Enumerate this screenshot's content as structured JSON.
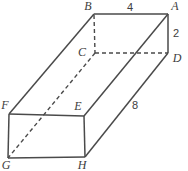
{
  "figure": {
    "shape": "rectangular-prism",
    "vertices": {
      "B": "B",
      "A": "A",
      "C": "C",
      "D": "D",
      "F": "F",
      "E": "E",
      "G": "G",
      "H": "H"
    },
    "dimensions": {
      "top_edge_BA": "4",
      "right_edge_AD": "2",
      "length_edge_DH": "8"
    }
  },
  "colors": {
    "line": "#4a4a4a",
    "label": "#3d3d3d",
    "background": "#ffffff"
  }
}
